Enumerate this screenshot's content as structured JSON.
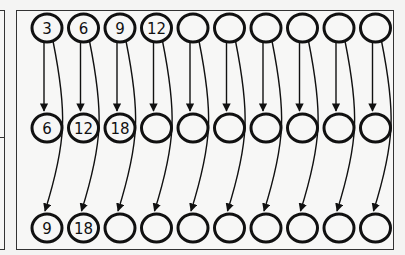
{
  "diagram": {
    "columns": 10,
    "rows": [
      {
        "name": "top",
        "labels": [
          "3",
          "6",
          "9",
          "12",
          "",
          "",
          "",
          "",
          "",
          ""
        ]
      },
      {
        "name": "middle",
        "labels": [
          "6",
          "12",
          "18",
          "",
          "",
          "",
          "",
          "",
          "",
          ""
        ]
      },
      {
        "name": "bottom",
        "labels": [
          "9",
          "18",
          "",
          "",
          "",
          "",
          "",
          "",
          "",
          ""
        ]
      }
    ],
    "colors": {
      "stroke": "#111111",
      "background": "#f4f4f3",
      "frame": "#333333"
    }
  }
}
